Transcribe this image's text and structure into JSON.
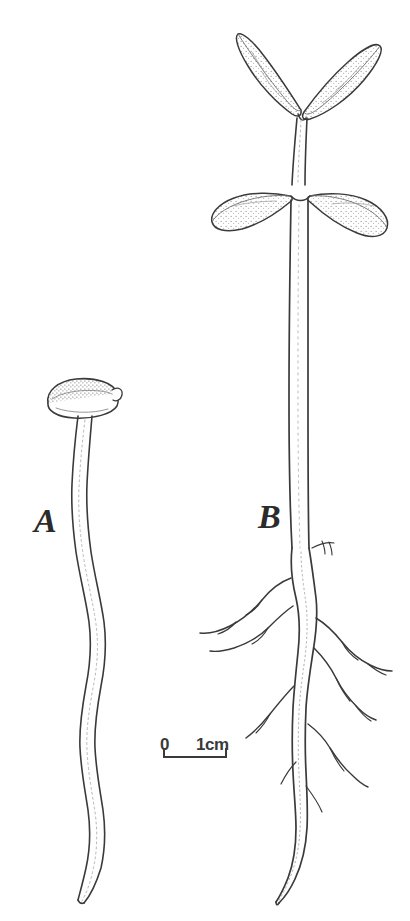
{
  "figure": {
    "kind": "botanical-line-drawing",
    "background_color": "#ffffff",
    "ink_color": "#3a3a3a",
    "stipple_color": "#6b6b6b",
    "width_px": 410,
    "height_px": 921
  },
  "specimens": [
    {
      "id": "A",
      "label": "A",
      "description": "Etiolated seedling: seed coat / cotyledon cap retained on a slender, wavy, unbranched hypocotyl-root axis",
      "parts": [
        "seed-cap",
        "hypocotyl",
        "unbranched-root"
      ],
      "has_leaves": false,
      "has_lateral_roots": false
    },
    {
      "id": "B",
      "label": "B",
      "description": "Normal seedling: two lance-shaped true leaves, a pair of spreading cotyledons, erect stem, and a branched taproot system",
      "parts": [
        "true-leaves",
        "cotyledons",
        "stem",
        "taproot",
        "lateral-roots"
      ],
      "has_leaves": true,
      "leaf_count": 2,
      "cotyledon_count": 2,
      "has_lateral_roots": true
    }
  ],
  "scale_bar": {
    "zero_label": "0",
    "length_label": "1cm",
    "represents_cm": 1,
    "bar_length_px": 64,
    "tick_style": "downward-end-ticks"
  }
}
